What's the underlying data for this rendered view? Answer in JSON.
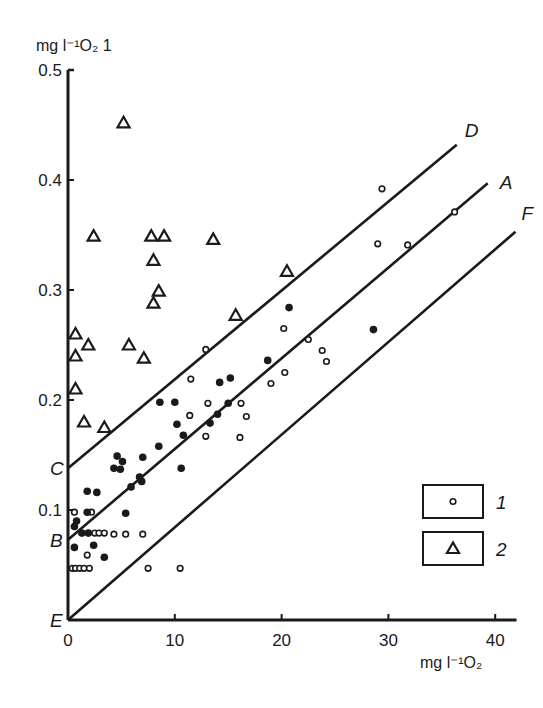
{
  "chart_data": {
    "type": "scatter",
    "title": "",
    "xlabel": "mg l⁻¹O₂",
    "ylabel": "mg l⁻¹O₂ 1",
    "xlim": [
      0,
      42
    ],
    "ylim": [
      0,
      0.5
    ],
    "x_ticks": [
      0,
      10,
      20,
      30,
      40
    ],
    "x_tick_labels": [
      "0",
      "10",
      "20",
      "30",
      "40"
    ],
    "y_ticks": [
      0.1,
      0.2,
      0.3,
      0.4,
      0.5
    ],
    "y_tick_labels": [
      "0.1",
      "0.2",
      "0.3",
      "0.4",
      "0.5"
    ],
    "grid": false,
    "legend_position": "lower right",
    "legend": [
      {
        "marker": "open-circle",
        "label": "1"
      },
      {
        "marker": "open-triangle",
        "label": "2"
      }
    ],
    "lines": [
      {
        "name": "D",
        "start_label": "C",
        "x": [
          0,
          36.4
        ],
        "y": [
          0.138,
          0.432
        ]
      },
      {
        "name": "A",
        "start_label": "B",
        "x": [
          0,
          39.3
        ],
        "y": [
          0.073,
          0.397
        ]
      },
      {
        "name": "F",
        "start_label": "E",
        "x": [
          0,
          41.9
        ],
        "y": [
          0.0,
          0.353
        ]
      }
    ],
    "series": [
      {
        "name": "1",
        "marker": "open-circle",
        "points": [
          [
            29.4,
            0.392
          ],
          [
            36.2,
            0.371
          ],
          [
            29.0,
            0.342
          ],
          [
            31.8,
            0.341
          ],
          [
            12.9,
            0.246
          ],
          [
            20.2,
            0.265
          ],
          [
            22.5,
            0.255
          ],
          [
            23.8,
            0.245
          ],
          [
            24.2,
            0.235
          ],
          [
            20.3,
            0.225
          ],
          [
            11.5,
            0.219
          ],
          [
            19.0,
            0.215
          ],
          [
            13.1,
            0.197
          ],
          [
            16.2,
            0.197
          ],
          [
            11.4,
            0.186
          ],
          [
            16.7,
            0.185
          ],
          [
            12.9,
            0.167
          ],
          [
            16.1,
            0.166
          ],
          [
            0.6,
            0.098
          ],
          [
            2.2,
            0.098
          ],
          [
            2.5,
            0.079
          ],
          [
            2.9,
            0.079
          ],
          [
            3.4,
            0.079
          ],
          [
            4.3,
            0.078
          ],
          [
            5.4,
            0.078
          ],
          [
            7.0,
            0.078
          ],
          [
            1.8,
            0.059
          ],
          [
            0.4,
            0.047
          ],
          [
            0.7,
            0.047
          ],
          [
            1.1,
            0.047
          ],
          [
            1.5,
            0.047
          ],
          [
            2.0,
            0.047
          ],
          [
            7.5,
            0.047
          ],
          [
            10.5,
            0.047
          ]
        ]
      },
      {
        "name": "filled",
        "marker": "filled-circle",
        "points": [
          [
            20.7,
            0.284
          ],
          [
            18.7,
            0.236
          ],
          [
            28.6,
            0.264
          ],
          [
            15.2,
            0.22
          ],
          [
            10.0,
            0.198
          ],
          [
            14.2,
            0.216
          ],
          [
            15.0,
            0.197
          ],
          [
            8.6,
            0.198
          ],
          [
            14.0,
            0.187
          ],
          [
            10.2,
            0.178
          ],
          [
            10.8,
            0.168
          ],
          [
            13.3,
            0.179
          ],
          [
            8.5,
            0.158
          ],
          [
            4.6,
            0.149
          ],
          [
            5.1,
            0.144
          ],
          [
            4.3,
            0.138
          ],
          [
            4.9,
            0.137
          ],
          [
            7.0,
            0.148
          ],
          [
            10.6,
            0.138
          ],
          [
            6.7,
            0.13
          ],
          [
            6.9,
            0.126
          ],
          [
            5.9,
            0.121
          ],
          [
            1.8,
            0.117
          ],
          [
            2.7,
            0.116
          ],
          [
            5.4,
            0.097
          ],
          [
            1.8,
            0.098
          ],
          [
            0.8,
            0.09
          ],
          [
            0.6,
            0.085
          ],
          [
            1.3,
            0.079
          ],
          [
            1.9,
            0.079
          ],
          [
            0.6,
            0.066
          ],
          [
            2.4,
            0.068
          ],
          [
            3.4,
            0.057
          ]
        ]
      },
      {
        "name": "2",
        "marker": "open-triangle",
        "points": [
          [
            5.2,
            0.452
          ],
          [
            2.4,
            0.349
          ],
          [
            7.8,
            0.349
          ],
          [
            9.0,
            0.349
          ],
          [
            13.6,
            0.346
          ],
          [
            8.0,
            0.327
          ],
          [
            8.5,
            0.299
          ],
          [
            8.0,
            0.288
          ],
          [
            20.5,
            0.317
          ],
          [
            15.7,
            0.277
          ],
          [
            0.7,
            0.26
          ],
          [
            1.9,
            0.25
          ],
          [
            5.7,
            0.25
          ],
          [
            0.7,
            0.24
          ],
          [
            7.1,
            0.238
          ],
          [
            0.7,
            0.21
          ],
          [
            1.5,
            0.18
          ],
          [
            3.4,
            0.175
          ]
        ]
      }
    ]
  }
}
